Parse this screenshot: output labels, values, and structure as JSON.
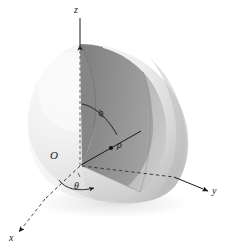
{
  "figure": {
    "background_color": "#ffffff",
    "width": 225,
    "height": 249,
    "axes": [
      {
        "name": "z-axis",
        "label": "z",
        "direction": "up",
        "style": "solid-with-dashed-interior",
        "arrow": true
      },
      {
        "name": "y-axis",
        "label": "y",
        "direction": "right",
        "style": "solid-with-dashed-interior",
        "arrow": true
      },
      {
        "name": "x-axis",
        "label": "x",
        "direction": "lower-left",
        "style": "solid-with-dashed-interior",
        "arrow": true
      }
    ],
    "origin": {
      "label": "O"
    },
    "annotations": [
      {
        "name": "polar-angle",
        "label": "ϕ",
        "description": "angle from positive z-axis to radius"
      },
      {
        "name": "radial-distance",
        "label": "ρ",
        "description": "distance from origin to point"
      },
      {
        "name": "azimuthal-angle",
        "label": "θ",
        "description": "angle from positive x-axis in xy-plane"
      }
    ],
    "colors": {
      "stroke": "#1a1a1a",
      "sphere_light": "#f2f2f2",
      "sphere_mid": "#d4d4d4",
      "sphere_dark": "#9a9a9a",
      "wedge_fill": "#8d8d8d",
      "wedge_fill_light": "#b9b9b9",
      "dashed": "#7a7a7a"
    }
  }
}
